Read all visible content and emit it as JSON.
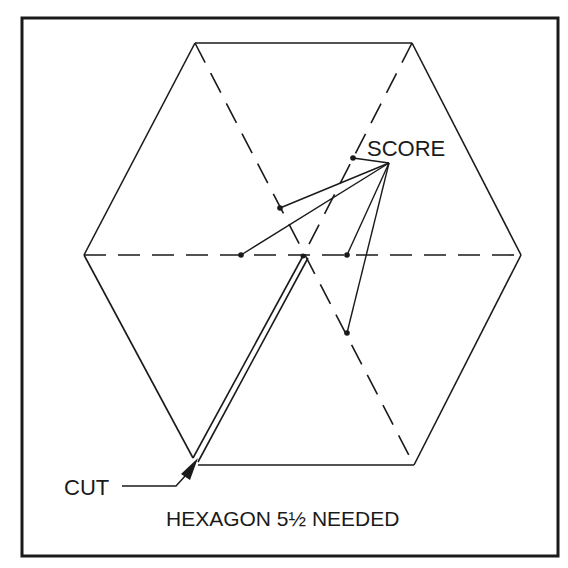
{
  "diagram": {
    "type": "technical-drawing",
    "labels": {
      "score": "SCORE",
      "cut": "CUT",
      "caption": "HEXAGON 5½ NEEDED"
    },
    "colors": {
      "ink": "#1a1a1a",
      "background": "#ffffff"
    },
    "hexagon": {
      "vertices": [
        [
          195,
          43
        ],
        [
          412,
          43
        ],
        [
          521,
          255
        ],
        [
          414,
          465
        ],
        [
          197,
          465
        ],
        [
          84,
          255
        ]
      ],
      "center": [
        303,
        256
      ]
    },
    "score_apex": [
      389,
      163
    ],
    "score_points": [
      [
        353,
        158
      ],
      [
        280,
        208
      ],
      [
        241,
        255
      ],
      [
        347,
        255
      ],
      [
        347,
        333
      ]
    ],
    "cut_arrow_tip": [
      198,
      460
    ]
  }
}
